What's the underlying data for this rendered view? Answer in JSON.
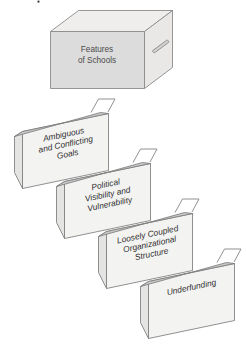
{
  "figure": {
    "title": "Features of Schools",
    "box": {
      "label_line1": "Features",
      "label_line2": "of Schools",
      "handle_name": "box-handle"
    },
    "colors": {
      "background": "#ffffff",
      "box_front": "#dcdcdc",
      "box_top": "#efeeec",
      "box_side": "#e9e8e6",
      "card_body": "#f3f3f2",
      "card_flange": "#c9c9c9",
      "card_left": "#e4e4e3",
      "outline": "#7d7d7d",
      "box_text": "#4a4a4a",
      "card_text": "#2e2e2e"
    },
    "cards": [
      {
        "id": "card-1",
        "lines": [
          "Ambiguous",
          "and Conflicting",
          "Goals"
        ],
        "full_label": "Ambiguous and Conflicting Goals"
      },
      {
        "id": "card-2",
        "lines": [
          "Political",
          "Visibility and",
          "Vulnerability"
        ],
        "full_label": "Political Visibility and Vulnerability"
      },
      {
        "id": "card-3",
        "lines": [
          "Loosely Coupled",
          "Organizational",
          "Structure"
        ],
        "full_label": "Loosely Coupled Organizational Structure"
      },
      {
        "id": "card-4",
        "lines": [
          "Underfunding",
          "",
          ""
        ],
        "full_label": "Underfunding"
      }
    ]
  }
}
